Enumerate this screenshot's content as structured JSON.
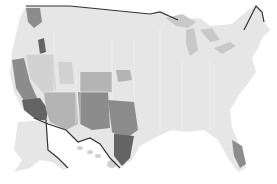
{
  "map": {
    "type": "choropleth",
    "geography": "US counties",
    "color_scheme": "grayscale",
    "colors": {
      "background": "#ffffff",
      "base": "#e6e6e6",
      "low": "#d2d2d2",
      "mid": "#b4b4b4",
      "high": "#8c8c8c",
      "highest": "#646464",
      "border": "#333333",
      "lakes": "#c8c8c8"
    },
    "regions": [
      {
        "name": "mainland",
        "level": "base"
      },
      {
        "name": "alaska",
        "level": "base"
      },
      {
        "name": "hawaii",
        "level": "low"
      },
      {
        "name": "pacific-northwest-cluster",
        "level": "high"
      },
      {
        "name": "idaho-cluster",
        "level": "highest"
      },
      {
        "name": "nevada",
        "level": "low"
      },
      {
        "name": "utah-cluster",
        "level": "low"
      },
      {
        "name": "california-central-valley",
        "level": "high"
      },
      {
        "name": "southern-california",
        "level": "highest"
      },
      {
        "name": "arizona",
        "level": "mid"
      },
      {
        "name": "new-mexico",
        "level": "high"
      },
      {
        "name": "colorado-south",
        "level": "mid"
      },
      {
        "name": "west-texas",
        "level": "high"
      },
      {
        "name": "south-texas",
        "level": "highest"
      },
      {
        "name": "kansas-cluster",
        "level": "mid"
      },
      {
        "name": "florida-south",
        "level": "high"
      },
      {
        "name": "great-lakes",
        "level": "lakes"
      }
    ]
  }
}
